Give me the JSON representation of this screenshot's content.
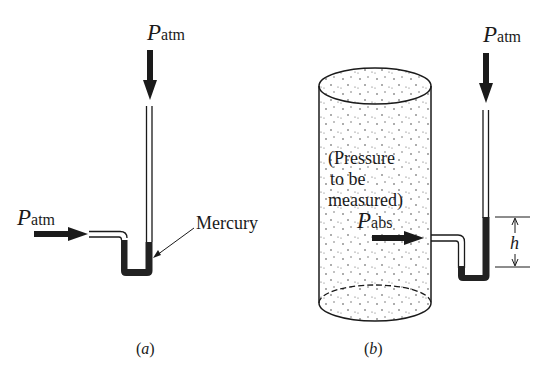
{
  "figure_a": {
    "caption_open": "(",
    "caption_letter": "a",
    "caption_close": ")",
    "top_label": {
      "symbol": "P",
      "subscript": "atm"
    },
    "left_label": {
      "symbol": "P",
      "subscript": "atm"
    },
    "mercury_label": "Mercury"
  },
  "figure_b": {
    "caption_open": "(",
    "caption_letter": "b",
    "caption_close": ")",
    "top_label": {
      "symbol": "P",
      "subscript": "atm"
    },
    "vessel_text": [
      "(Pressure",
      "to be",
      "measured)"
    ],
    "inlet_label": {
      "symbol": "P",
      "subscript": "abs"
    },
    "height_label": "h"
  },
  "colors": {
    "ink": "#1a1a1a",
    "mercury": "#222222",
    "background": "#ffffff"
  }
}
